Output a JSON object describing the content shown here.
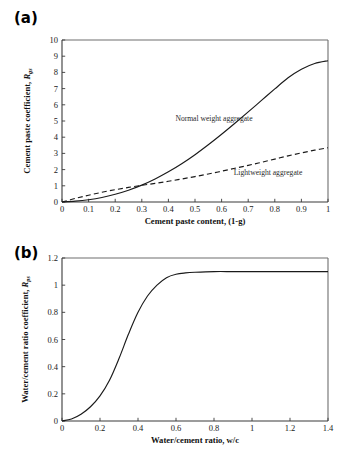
{
  "figure": {
    "panels": [
      {
        "tag": "(a)",
        "xlabel": "Cement paste content, (1-g)",
        "ylabel_main": "Cement  paste coefficient, ",
        "ylabel_sym": "R",
        "ylabel_sub": "gs"
      },
      {
        "tag": "(b)",
        "xlabel": "Water/cement ratio, w/c",
        "ylabel_main": "Water/cement ratio coefficient, ",
        "ylabel_sym": "R",
        "ylabel_sub": "ps"
      }
    ]
  },
  "chart_data": [
    {
      "type": "line",
      "title": "",
      "panel": "(a)",
      "xlabel": "Cement paste content, (1-g)",
      "ylabel": "Cement  paste coefficient, R_gs",
      "xlim": [
        0,
        1
      ],
      "ylim": [
        0,
        10
      ],
      "xticks": [
        "0",
        "0.1",
        "0.2",
        "0.3",
        "0.4",
        "0.5",
        "0.6",
        "0.7",
        "0.8",
        "0.9",
        "1"
      ],
      "xtick_values": [
        0,
        0.1,
        0.2,
        0.3,
        0.4,
        0.5,
        0.6,
        0.7,
        0.8,
        0.9,
        1
      ],
      "yticks": [
        "0",
        "1",
        "2",
        "3",
        "4",
        "5",
        "6",
        "7",
        "8",
        "9",
        "10"
      ],
      "ytick_values": [
        0,
        1,
        2,
        3,
        4,
        5,
        6,
        7,
        8,
        9,
        10
      ],
      "grid": false,
      "legend": "inline-annotations",
      "series": [
        {
          "name": "Normal weight aggregate",
          "style": "solid",
          "annotation": "Normal weight aggregate",
          "x": [
            0,
            0.05,
            0.1,
            0.15,
            0.2,
            0.25,
            0.3,
            0.35,
            0.4,
            0.45,
            0.5,
            0.55,
            0.6,
            0.65,
            0.7,
            0.75,
            0.8,
            0.85,
            0.9,
            0.95,
            1
          ],
          "y": [
            0,
            0.05,
            0.14,
            0.28,
            0.48,
            0.73,
            1.04,
            1.42,
            1.86,
            2.36,
            2.92,
            3.53,
            4.18,
            4.86,
            5.56,
            6.27,
            6.98,
            7.67,
            8.2,
            8.55,
            8.72
          ]
        },
        {
          "name": "Lightweight aggregate",
          "style": "dashed",
          "annotation": "Lightweight aggregate",
          "x": [
            0,
            0.05,
            0.1,
            0.15,
            0.2,
            0.25,
            0.3,
            0.35,
            0.4,
            0.45,
            0.5,
            0.55,
            0.6,
            0.65,
            0.7,
            0.75,
            0.8,
            0.85,
            0.9,
            0.95,
            1
          ],
          "y": [
            0,
            0.22,
            0.42,
            0.6,
            0.76,
            0.9,
            1.03,
            1.15,
            1.28,
            1.42,
            1.57,
            1.73,
            1.9,
            2.08,
            2.26,
            2.45,
            2.65,
            2.85,
            3.03,
            3.2,
            3.35
          ]
        }
      ]
    },
    {
      "type": "line",
      "title": "",
      "panel": "(b)",
      "xlabel": "Water/cement ratio, w/c",
      "ylabel": "Water/cement ratio coefficient, R_ps",
      "xlim": [
        0,
        1.4
      ],
      "ylim": [
        0,
        1.2
      ],
      "xticks": [
        "0",
        "0.2",
        "0.4",
        "0.6",
        "0.8",
        "1",
        "1.2",
        "1.4"
      ],
      "xtick_values": [
        0,
        0.2,
        0.4,
        0.6,
        0.8,
        1,
        1.2,
        1.4
      ],
      "yticks": [
        "0",
        "0.2",
        "0.4",
        "0.6",
        "0.8",
        "1",
        "1.2"
      ],
      "ytick_values": [
        0,
        0.2,
        0.4,
        0.6,
        0.8,
        1,
        1.2
      ],
      "grid": false,
      "legend": "none",
      "series": [
        {
          "name": "Water/cement ratio coefficient",
          "style": "solid",
          "annotation": "",
          "x": [
            0,
            0.05,
            0.1,
            0.15,
            0.2,
            0.25,
            0.3,
            0.35,
            0.4,
            0.45,
            0.5,
            0.55,
            0.6,
            0.65,
            0.7,
            0.8,
            0.9,
            1.0,
            1.1,
            1.2,
            1.3,
            1.4
          ],
          "y": [
            0,
            0.015,
            0.05,
            0.105,
            0.185,
            0.3,
            0.46,
            0.64,
            0.8,
            0.92,
            1.0,
            1.055,
            1.08,
            1.09,
            1.095,
            1.1,
            1.1,
            1.1,
            1.1,
            1.1,
            1.1,
            1.1
          ]
        }
      ]
    }
  ]
}
